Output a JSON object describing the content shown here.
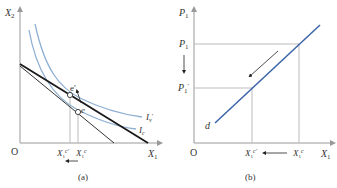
{
  "panel_a": {
    "caption": "(a)",
    "origin": "O",
    "y_axis_label": "X",
    "y_axis_sub": "2",
    "x_axis_label": "X",
    "x_axis_sub": "1",
    "curves": [
      {
        "name": "I",
        "sub": "v",
        "prime": "′",
        "color": "#8fb0d4"
      },
      {
        "name": "I",
        "sub": "c",
        "prime": "",
        "color": "#8fb0d4"
      }
    ],
    "budget_lines": [
      {
        "name": "original budget line",
        "color": "#1a1a1a",
        "weight": "thick"
      },
      {
        "name": "new budget line",
        "color": "#333333",
        "weight": "thin"
      }
    ],
    "points": [
      {
        "label": "e",
        "prime": "′"
      },
      {
        "label": "e",
        "prime": ""
      }
    ],
    "x_ticks": [
      {
        "base": "X",
        "sub": "1",
        "sup": "c′"
      },
      {
        "base": "X",
        "sub": "1",
        "sup": "c"
      }
    ],
    "arrow_note": "shift left from X1c to X1c′"
  },
  "panel_b": {
    "caption": "(b)",
    "origin": "O",
    "y_axis_label": "P",
    "y_axis_sub": "1",
    "x_axis_label": "X",
    "x_axis_sub": "1",
    "y_ticks": [
      {
        "base": "P",
        "sub": "1",
        "prime": ""
      },
      {
        "base": "P",
        "sub": "1",
        "prime": "′"
      }
    ],
    "x_ticks": [
      {
        "base": "X",
        "sub": "1",
        "sup": "c′"
      },
      {
        "base": "X",
        "sub": "1",
        "sup": "c"
      }
    ],
    "curve_label": "d",
    "curve_color": "#3a64a8",
    "arrow_note": "price falls P1 to P1′, quantity moves X1c to X1c′"
  },
  "colors": {
    "axis": "#999999",
    "guide": "#bbbbbb",
    "indifference": "#8fb0d4",
    "demand": "#3a64a8",
    "text": "#333333"
  }
}
